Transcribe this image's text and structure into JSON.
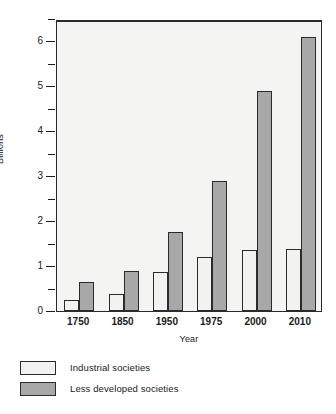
{
  "chart_data": {
    "type": "bar",
    "title": "",
    "subtitle": "",
    "xlabel": "Year",
    "ylabel": "Billions",
    "categories": [
      "1750",
      "1850",
      "1950",
      "1975",
      "2000",
      "2010"
    ],
    "series": [
      {
        "name": "Industrial societies",
        "color": "#f2f2f0",
        "values": [
          0.25,
          0.37,
          0.87,
          1.2,
          1.35,
          1.37
        ]
      },
      {
        "name": "Less developed societies",
        "color": "#a8a8a8",
        "values": [
          0.65,
          0.9,
          1.75,
          2.9,
          4.9,
          6.1
        ]
      }
    ],
    "ylim": [
      0,
      6.5
    ],
    "y_major_ticks": [
      0,
      1,
      2,
      3,
      4,
      5,
      6
    ],
    "y_major_tick_labels": [
      "0",
      "1",
      "2",
      "3",
      "4",
      "5",
      "6"
    ],
    "y_minor_ticks": [
      0.5,
      1.5,
      2.5,
      3.5,
      4.5,
      5.5,
      6.5
    ],
    "grid": false,
    "legend_position": "below-left",
    "bar_border_color": "#2b2b2b",
    "plot_background": "#f4f4f2"
  }
}
